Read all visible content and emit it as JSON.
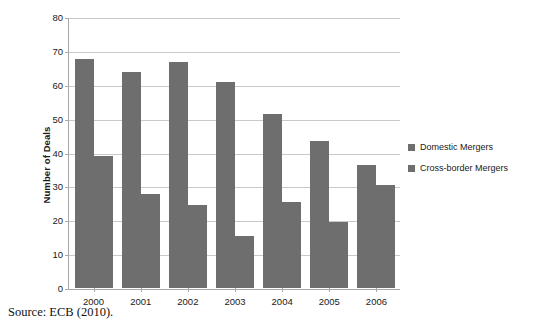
{
  "chart_data": {
    "type": "bar",
    "title": "",
    "subtitle": "",
    "xlabel": "",
    "ylabel": "Number of Deals",
    "categories": [
      "2000",
      "2001",
      "2002",
      "2003",
      "2004",
      "2005",
      "2006"
    ],
    "series": [
      {
        "name": "Domestic Mergers",
        "color": "#6e6e6e",
        "values": [
          68,
          64,
          67,
          61,
          51.5,
          43.5,
          36.5
        ]
      },
      {
        "name": "Cross-border Mergers",
        "color": "#6e6e6e",
        "values": [
          39,
          28,
          24.5,
          15.5,
          25.5,
          19.5,
          30.5
        ]
      }
    ],
    "ylim": [
      0,
      80
    ],
    "yticks": [
      0,
      10,
      20,
      30,
      40,
      50,
      60,
      70,
      80
    ],
    "ytick_labels": [
      "0",
      "10",
      "20",
      "30",
      "40",
      "50",
      "60",
      "70",
      "80"
    ],
    "grid": true,
    "legend_position": "right"
  },
  "legend": {
    "entries": [
      {
        "label": "Domestic Mergers",
        "swatch": "legend-swatch-domestic"
      },
      {
        "label": "Cross-border Mergers",
        "swatch": "legend-swatch-cross-border"
      }
    ]
  },
  "footer": {
    "source": "Source: ECB (2010)."
  }
}
